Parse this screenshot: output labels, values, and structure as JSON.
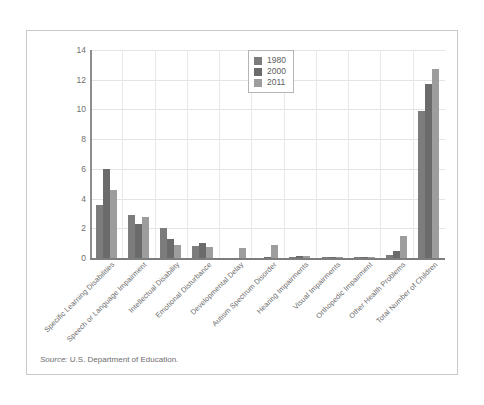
{
  "source_note": {
    "lead": "Source:",
    "text": " U.S. Department of Education."
  },
  "legend": {
    "position": "top-center-right",
    "items": [
      {
        "label": "1980",
        "color": "#7c7c7c"
      },
      {
        "label": "2000",
        "color": "#6b6b6b"
      },
      {
        "label": "2011",
        "color": "#9d9d9d"
      }
    ]
  },
  "axis": {
    "y_ticks": [
      "0",
      "2",
      "4",
      "6",
      "8",
      "10",
      "12",
      "14"
    ]
  },
  "chart_data": {
    "type": "bar",
    "title": "",
    "subtitle": "",
    "xlabel": "",
    "ylabel": "",
    "ylim": [
      0,
      14
    ],
    "ytick_step": 2,
    "grid": true,
    "legend_position": "top-right-inside",
    "categories": [
      "Specific Learning Disabilities",
      "Speech or Language Impairment",
      "Intellectual Disability",
      "Emotional Disturbance",
      "Developmental Delay",
      "Autism Spectrum Disorder",
      "Hearing Impairments",
      "Visual Impairments",
      "Orthopedic Impairment",
      "Other Health Problems",
      "Total Number of Children"
    ],
    "series": [
      {
        "name": "1980",
        "color": "#7c7c7c",
        "values": [
          3.6,
          2.9,
          2.0,
          0.8,
          0.0,
          0.0,
          0.1,
          0.05,
          0.1,
          0.2,
          9.9
        ]
      },
      {
        "name": "2000",
        "color": "#6b6b6b",
        "values": [
          6.0,
          2.3,
          1.3,
          1.0,
          0.0,
          0.1,
          0.15,
          0.05,
          0.1,
          0.45,
          11.7
        ]
      },
      {
        "name": "2011",
        "color": "#9d9d9d",
        "values": [
          4.6,
          2.75,
          0.85,
          0.75,
          0.7,
          0.85,
          0.12,
          0.05,
          0.1,
          1.45,
          12.75
        ]
      }
    ]
  }
}
